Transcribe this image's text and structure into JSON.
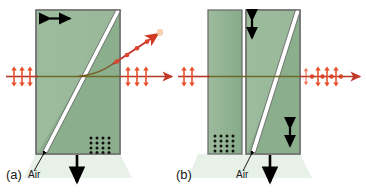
{
  "figure": {
    "type": "optics-diagram",
    "background": "#ffffff",
    "crystal_fill": "#93b394",
    "crystal_fill_light": "#a8c2a6",
    "crystal_fill_dark": "#7fa383",
    "crystal_border": "#6d6d6d",
    "air_gap_color": "#ffffff",
    "beam_color": "#c0392b",
    "beam_color_dark": "#7a4a22",
    "marker_color": "#e8502a",
    "arrow_color": "#000000",
    "shadow_color": "#e3eee3"
  },
  "panels": [
    {
      "id": "a",
      "label": "(a)",
      "air_label": "Air",
      "optic_axis_top": {
        "name": "horizontal-double-arrow",
        "orientation": "horizontal"
      },
      "optic_axis_bottom": {
        "name": "dot-grid",
        "orientation": "out-of-plane",
        "rows": 4,
        "cols": 4
      },
      "down_arrow": {
        "name": "down-arrow",
        "orientation": "down"
      },
      "input_beam": {
        "polarization": "vertical-double-arrows",
        "markers": 3,
        "direction": "right"
      },
      "output_beams": [
        {
          "polarization": "vertical-double-arrows",
          "markers": 3,
          "direction": "right",
          "path": "straight"
        },
        {
          "polarization": "dots",
          "markers": 4,
          "direction": "up-right",
          "path": "deflected"
        }
      ]
    },
    {
      "id": "b",
      "label": "(b)",
      "air_label": "Air",
      "optic_axis_top": {
        "name": "vertical-double-arrow",
        "orientation": "vertical"
      },
      "optic_axis_bottom": {
        "name": "vertical-double-arrow",
        "orientation": "vertical"
      },
      "dot_grid": {
        "name": "dot-grid",
        "orientation": "out-of-plane",
        "rows": 4,
        "cols": 4
      },
      "down_arrow": {
        "name": "down-arrow",
        "orientation": "down"
      },
      "input_beam": {
        "polarization": "vertical-double-arrows",
        "markers": 2,
        "direction": "right"
      },
      "output_beams": [
        {
          "polarization": "mixed-arrows-and-dots",
          "markers": 5,
          "direction": "right",
          "path": "straight"
        }
      ]
    }
  ]
}
